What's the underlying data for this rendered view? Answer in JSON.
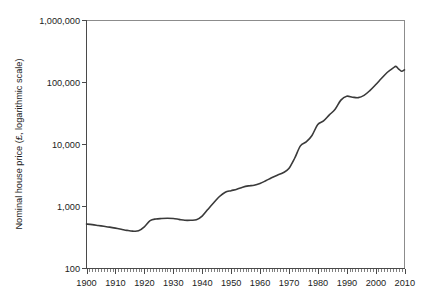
{
  "chart_data": {
    "type": "line",
    "title": "",
    "xlabel": "",
    "ylabel": "Nominal house price (£, logarithmic scale)",
    "yscale": "log",
    "ylim": [
      100,
      1000000
    ],
    "xlim": [
      1900,
      2010
    ],
    "grid": false,
    "legend_position": "none",
    "ytick_labels": [
      "100",
      "1,000",
      "10,000",
      "100,000",
      "1,000,000"
    ],
    "ytick_values": [
      100,
      1000,
      10000,
      100000,
      1000000
    ],
    "xtick_labels": [
      "1900",
      "1910",
      "1920",
      "1930",
      "1940",
      "1950",
      "1960",
      "1970",
      "1980",
      "1990",
      "2000",
      "2010"
    ],
    "xtick_values": [
      1900,
      1910,
      1920,
      1930,
      1940,
      1950,
      1960,
      1970,
      1980,
      1990,
      2000,
      2010
    ],
    "x_minor_tick_interval": 1,
    "line_color": "#3a3a3a",
    "series": [
      {
        "name": "Nominal house price",
        "x": [
          1900,
          1902,
          1904,
          1906,
          1908,
          1910,
          1912,
          1914,
          1916,
          1918,
          1920,
          1922,
          1924,
          1926,
          1928,
          1930,
          1932,
          1934,
          1936,
          1938,
          1940,
          1942,
          1944,
          1946,
          1948,
          1950,
          1952,
          1954,
          1956,
          1958,
          1960,
          1962,
          1964,
          1966,
          1968,
          1970,
          1972,
          1974,
          1976,
          1978,
          1980,
          1982,
          1984,
          1986,
          1988,
          1990,
          1992,
          1994,
          1996,
          1998,
          2000,
          2002,
          2004,
          2006,
          2007,
          2008,
          2009,
          2010
        ],
        "values": [
          520,
          510,
          495,
          480,
          465,
          448,
          430,
          412,
          400,
          405,
          470,
          590,
          630,
          640,
          645,
          640,
          620,
          600,
          600,
          610,
          700,
          900,
          1150,
          1450,
          1700,
          1800,
          1900,
          2050,
          2150,
          2200,
          2350,
          2600,
          2900,
          3200,
          3500,
          4100,
          6000,
          9500,
          11000,
          14000,
          21000,
          24000,
          30000,
          37000,
          52000,
          60000,
          58000,
          57000,
          62000,
          74000,
          92000,
          116000,
          145000,
          170000,
          182000,
          165000,
          152000,
          160000
        ]
      }
    ],
    "annotations": []
  }
}
